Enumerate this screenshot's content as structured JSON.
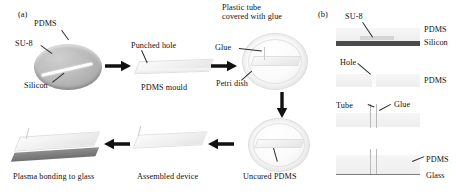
{
  "figure": {
    "panel_a_tag": "(a)",
    "panel_b_tag": "(b)"
  },
  "panel_a": {
    "steps": [
      {
        "id": "su8-master",
        "labels": {
          "pdms": "PDMS",
          "su8": "SU-8",
          "silicon": "Silicon"
        }
      },
      {
        "id": "pdms-mould",
        "labels": {
          "punched_hole": "Punched hole",
          "caption": "PDMS mould"
        }
      },
      {
        "id": "glue-petri",
        "labels": {
          "glue": "Glue",
          "petri_dish": "Petri dish",
          "plastic_tube": "Plastic tube",
          "covered_with_glue": "covered with glue"
        }
      },
      {
        "id": "uncured-pdms",
        "labels": {
          "caption": "Uncured PDMS"
        }
      },
      {
        "id": "assembled-device",
        "labels": {
          "caption": "Assembled device"
        }
      },
      {
        "id": "plasma-bonding",
        "labels": {
          "caption": "Plasma bonding to glass"
        }
      }
    ]
  },
  "panel_b": {
    "rows": [
      {
        "id": "su8-on-silicon",
        "labels": {
          "su8": "SU-8",
          "pdms": "PDMS",
          "silicon": "Silicon"
        }
      },
      {
        "id": "punched-hole",
        "labels": {
          "hole": "Hole",
          "pdms": "PDMS"
        }
      },
      {
        "id": "tube-glued",
        "labels": {
          "tube": "Tube",
          "glue": "Glue"
        }
      },
      {
        "id": "bonded-to-glass",
        "labels": {
          "pdms": "PDMS",
          "glass": "Glass"
        }
      }
    ]
  },
  "colors": {
    "silicon": "#4a4a4a",
    "glass": "#7e7e7e",
    "pdms": "#f1f1f1",
    "arrow": "#111111",
    "text": "#111111"
  }
}
